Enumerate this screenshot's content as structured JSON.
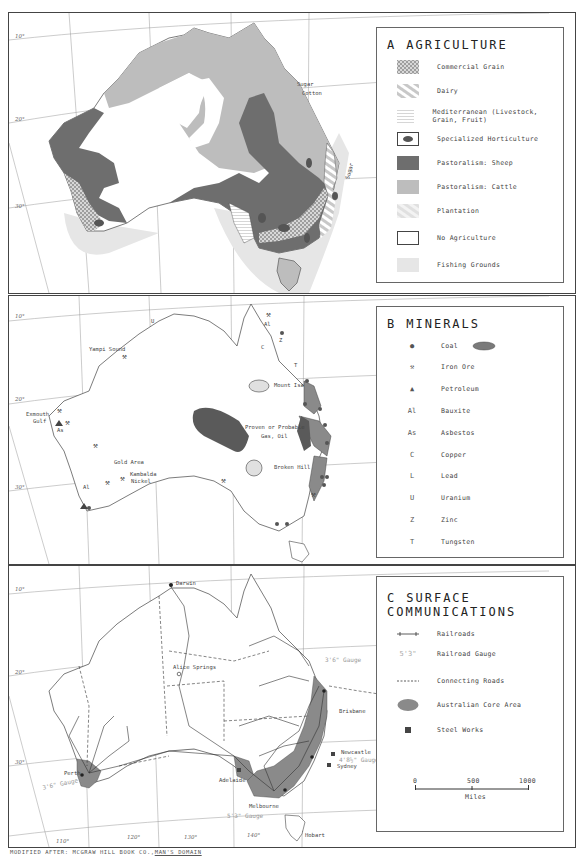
{
  "panels": {
    "agriculture": {
      "letter": "A",
      "title": "AGRICULTURE",
      "legend": [
        {
          "label": "Commercial Grain",
          "swatch": "crosshatch"
        },
        {
          "label": "Dairy",
          "swatch": "diagonal"
        },
        {
          "label": "Mediterranean (Livestock, Grain, Fruit)",
          "swatch": "horizontal"
        },
        {
          "label": "Specialized Horticulture",
          "swatch": "oval-dark"
        },
        {
          "label": "Pastoralism: Sheep",
          "swatch": "dark-gray"
        },
        {
          "label": "Pastoralism: Cattle",
          "swatch": "light-gray"
        },
        {
          "label": "Plantation",
          "swatch": "light-diagonal"
        },
        {
          "label": "No Agriculture",
          "swatch": "white"
        },
        {
          "label": "Fishing Grounds",
          "swatch": "very-light-gray"
        }
      ],
      "map_labels": {
        "sugar_cotton_1": "Sugar",
        "sugar_cotton_2": "Cotton",
        "sugar_east": "Sugar"
      },
      "latitudes": [
        "10°",
        "20°",
        "30°"
      ]
    },
    "minerals": {
      "letter": "B",
      "title": "MINERALS",
      "legend": [
        {
          "symbol": "●",
          "label": "Coal",
          "extra": "coal-field-oval"
        },
        {
          "symbol": "⚒",
          "label": "Iron Ore"
        },
        {
          "symbol": "▲",
          "label": "Petroleum"
        },
        {
          "symbol": "Al",
          "label": "Bauxite"
        },
        {
          "symbol": "As",
          "label": "Asbestos"
        },
        {
          "symbol": "C",
          "label": "Copper"
        },
        {
          "symbol": "L",
          "label": "Lead"
        },
        {
          "symbol": "U",
          "label": "Uranium"
        },
        {
          "symbol": "Z",
          "label": "Zinc"
        },
        {
          "symbol": "T",
          "label": "Tungsten"
        }
      ],
      "map_labels": {
        "yampi": "Yampi Sound",
        "exmouth_1": "Exmouth",
        "exmouth_2": "Gulf",
        "as": "As",
        "al_west": "Al",
        "gold": "Gold Area",
        "kambalda_1": "Kambalda",
        "kambalda_2": "Nickel",
        "mount_isa": "Mount Isa",
        "proven_1": "Proven or Probable",
        "proven_2": "Gas, Oil",
        "broken_hill": "Broken Hill",
        "al_north": "Al",
        "z_north": "Z",
        "c_north": "C",
        "t_north": "T",
        "u_north": "U"
      },
      "latitudes": [
        "10°",
        "20°",
        "30°"
      ]
    },
    "communications": {
      "letter": "C",
      "title": "SURFACE COMMUNICATIONS",
      "legend": [
        {
          "symbol": "railroad",
          "label": "Railroads"
        },
        {
          "symbol": "5'3\"",
          "label": "Railroad Gauge"
        },
        {
          "symbol": "dashed",
          "label": "Connecting Roads"
        },
        {
          "symbol": "core-oval",
          "label": "Australian Core Area"
        },
        {
          "symbol": "square",
          "label": "Steel Works"
        }
      ],
      "scale": {
        "ticks": [
          "0",
          "500",
          "1000"
        ],
        "unit": "Miles"
      },
      "map_labels": {
        "darwin": "Darwin",
        "alice": "Alice Springs",
        "perth": "Perth",
        "gauge_west": "3'6\" Gauge",
        "adelaide": "Adelaide",
        "melbourne": "Melbourne",
        "gauge_south": "5'3\" Gauge",
        "sydney": "Sydney",
        "newcastle": "Newcastle",
        "gauge_sydney": "4'8½\" Gauge",
        "brisbane": "Brisbane",
        "gauge_east": "3'6\" Gauge",
        "hobart": "Hobart"
      },
      "latitudes": [
        "10°",
        "20°",
        "30°"
      ],
      "longitudes": [
        "110°",
        "120°",
        "130°",
        "140°"
      ]
    }
  },
  "footer": {
    "prefix": "MODIFIED AFTER: MCGRAW HILL BOOK CO.,",
    "source": "MAN'S DOMAIN"
  },
  "colors": {
    "sheep": "#6e6e6e",
    "cattle": "#bdbdbd",
    "fishing": "#e6e6e6",
    "core": "#8a8a8a",
    "coal_field": "#7a7a7a",
    "gas_oil": "#5a5a5a",
    "border": "#444444"
  }
}
